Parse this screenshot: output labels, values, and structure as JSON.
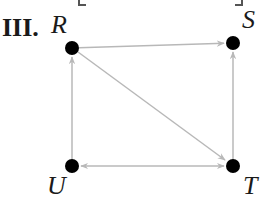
{
  "figure": {
    "label": "III.",
    "edge_color": "#b8b8b8",
    "node_color": "#000000",
    "nodes": [
      {
        "id": "R",
        "label": "R",
        "x": 72,
        "y": 48
      },
      {
        "id": "S",
        "label": "S",
        "x": 233,
        "y": 43
      },
      {
        "id": "U",
        "label": "U",
        "x": 72,
        "y": 166
      },
      {
        "id": "T",
        "label": "T",
        "x": 233,
        "y": 166
      }
    ],
    "edges": [
      {
        "from": "R",
        "to": "S",
        "direction": "forward"
      },
      {
        "from": "U",
        "to": "R",
        "direction": "forward"
      },
      {
        "from": "T",
        "to": "S",
        "direction": "forward"
      },
      {
        "from": "R",
        "to": "T",
        "direction": "forward"
      },
      {
        "from": "U",
        "to": "T",
        "direction": "both"
      }
    ]
  }
}
